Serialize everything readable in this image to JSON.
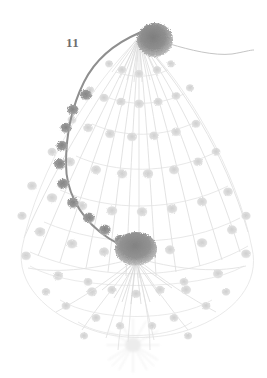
{
  "plate": {
    "width": 267,
    "height": 378,
    "background_color": "#ffffff",
    "figure_label": "11",
    "label_color": "#6e6e6e",
    "subject": "botanical-line-illustration",
    "description": "Pale grey stippled botanical illustration of a drooping umbel inflorescence: a dense spherical flower-head at the apex, a second dense spherical head at the centre, numerous faint radiating stalks forming a teardrop-shaped canopy, and a darker beaded stem curving down the left side."
  },
  "palette": {
    "background": "#ffffff",
    "faint_line": "#e4e4e4",
    "pale_line": "#dcdcdc",
    "mid_line": "#cfcfcf",
    "node_pale": "#e0e0e0",
    "node_mid": "#c8c8c8",
    "dark_stem": "#8c8c8c",
    "dark_node": "#8f8f8f",
    "ball_core": "#8a8a8a",
    "ball_edge": "#bdbdbd",
    "label": "#6e6e6e"
  },
  "elements": {
    "apex_ball": {
      "name": "apex flower head",
      "cx": 155,
      "cy": 40,
      "rx": 18,
      "ry": 17,
      "tone": "dark"
    },
    "central_ball": {
      "name": "central flower head",
      "cx": 136,
      "cy": 249,
      "rx": 21,
      "ry": 17,
      "tone": "dark"
    },
    "trailing_filament": {
      "name": "trailing filament to the right",
      "from_x": 172,
      "from_y": 44,
      "to_x": 252,
      "to_y": 52
    },
    "beaded_stem": {
      "name": "beaded stem curving down the left",
      "bead_count": 13,
      "from_x": 139,
      "from_y": 35,
      "to_x": 136,
      "to_y": 249
    },
    "canopy": {
      "name": "radiating stalk canopy",
      "apex_x": 139,
      "apex_y": 38,
      "ray_count": 13,
      "tier_count": 7,
      "spread_left": 18,
      "spread_right": 250,
      "base_y": 262
    },
    "lower_skirt": {
      "name": "lower skirt of pendant stalks",
      "origin_x": 136,
      "origin_y": 258,
      "ray_count": 11,
      "base_y": 340
    },
    "bottom_burst": {
      "name": "bottom starburst floret",
      "cx": 133,
      "cy": 345,
      "radius": 26
    }
  },
  "annotations": {
    "caption": "11"
  }
}
